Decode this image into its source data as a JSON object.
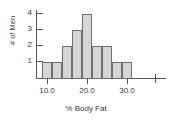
{
  "chart_data": {
    "type": "bar",
    "title": "",
    "subtitle": "",
    "xlabel": "% Body Fat",
    "ylabel": "# of Men",
    "categories": [
      "10.0-12.5",
      "12.5-15.0",
      "15.0-17.5",
      "17.5-20.0",
      "20.0-22.5",
      "22.5-25.0",
      "25.0-27.5",
      "27.5-30.0",
      "30.0-32.5"
    ],
    "bin_edges": [
      10.0,
      12.5,
      15.0,
      17.5,
      20.0,
      22.5,
      25.0,
      27.5,
      30.0,
      32.5
    ],
    "values": [
      1,
      1,
      2,
      3,
      4,
      2,
      2,
      1,
      1
    ],
    "bin_width": 2.5,
    "xlim": [
      7.5,
      42.5
    ],
    "ylim": [
      0,
      4.4
    ],
    "x_ticks": [
      10.0,
      20.0,
      30.0,
      40.0
    ],
    "x_tick_labels": [
      "10.0",
      "20.0",
      "30.0",
      ""
    ],
    "y_ticks": [
      1,
      2,
      3,
      4
    ],
    "y_tick_labels": [
      "1",
      "2",
      "3",
      "4"
    ],
    "grid": false,
    "legend": "none",
    "bar_fill_color": "#d6d6d6",
    "bar_edge_color": "#6f6f6f",
    "axis_color": "#555555",
    "text_color": "#3a3a3a"
  },
  "axis": {
    "y_title": "# of Men",
    "x_title": "% Body Fat",
    "y_labels": [
      "4",
      "3",
      "2",
      "1"
    ],
    "x_labels": [
      "10.0",
      "20.0",
      "30.0"
    ]
  }
}
